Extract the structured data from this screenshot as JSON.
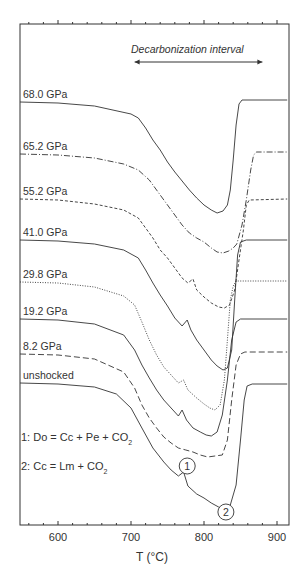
{
  "chart_data": {
    "type": "line",
    "title": "",
    "xlabel": "T (°C)",
    "ylabel": "",
    "xlim": [
      545,
      914
    ],
    "x_ticks": [
      600,
      700,
      800,
      900
    ],
    "x_tick_labels": [
      "600",
      "700",
      "800",
      "900"
    ],
    "grid": false,
    "annotation_arrow": {
      "text": "Decarbonization interval",
      "x_from": 705,
      "x_to": 880
    },
    "reactions": [
      {
        "label": "1: Do = Cc + Pe + CO",
        "sub": "2"
      },
      {
        "label": "2: Cc = Lm + CO",
        "sub": "2"
      }
    ],
    "markers": [
      {
        "text": "1",
        "x": 777,
        "y_px": 466
      },
      {
        "text": "2",
        "x": 830,
        "y_px": 512
      }
    ],
    "y_units": "relative signal (px from top, offset curves)",
    "series": [
      {
        "name": "68.0 GPa",
        "style": "solid",
        "label_y": 101,
        "points": [
          [
            545,
            102
          ],
          [
            600,
            103
          ],
          [
            650,
            106
          ],
          [
            700,
            114
          ],
          [
            710,
            118
          ],
          [
            720,
            128
          ],
          [
            730,
            140
          ],
          [
            740,
            150
          ],
          [
            750,
            162
          ],
          [
            760,
            172
          ],
          [
            770,
            181
          ],
          [
            780,
            190
          ],
          [
            790,
            198
          ],
          [
            800,
            205
          ],
          [
            810,
            210
          ],
          [
            818,
            213
          ],
          [
            826,
            211
          ],
          [
            832,
            205
          ],
          [
            836,
            190
          ],
          [
            840,
            160
          ],
          [
            844,
            125
          ],
          [
            848,
            104
          ],
          [
            852,
            100
          ],
          [
            914,
            100
          ]
        ]
      },
      {
        "name": "65.2 GPa",
        "style": "dashdot",
        "label_y": 153,
        "points": [
          [
            545,
            154
          ],
          [
            600,
            155
          ],
          [
            650,
            158
          ],
          [
            690,
            164
          ],
          [
            710,
            170
          ],
          [
            725,
            180
          ],
          [
            740,
            195
          ],
          [
            750,
            205
          ],
          [
            760,
            215
          ],
          [
            770,
            225
          ],
          [
            780,
            233
          ],
          [
            790,
            238
          ],
          [
            800,
            242
          ],
          [
            810,
            248
          ],
          [
            818,
            252
          ],
          [
            826,
            253
          ],
          [
            834,
            251
          ],
          [
            840,
            248
          ],
          [
            845,
            244
          ],
          [
            852,
            225
          ],
          [
            858,
            200
          ],
          [
            864,
            170
          ],
          [
            868,
            155
          ],
          [
            872,
            152
          ],
          [
            914,
            152
          ]
        ]
      },
      {
        "name": "55.2 GPa",
        "style": "dashed",
        "label_y": 198,
        "points": [
          [
            545,
            199
          ],
          [
            600,
            200
          ],
          [
            650,
            204
          ],
          [
            690,
            210
          ],
          [
            710,
            218
          ],
          [
            720,
            228
          ],
          [
            730,
            238
          ],
          [
            740,
            250
          ],
          [
            750,
            258
          ],
          [
            760,
            268
          ],
          [
            770,
            278
          ],
          [
            778,
            283
          ],
          [
            785,
            279
          ],
          [
            790,
            290
          ],
          [
            800,
            297
          ],
          [
            810,
            303
          ],
          [
            820,
            307
          ],
          [
            828,
            308
          ],
          [
            835,
            305
          ],
          [
            842,
            290
          ],
          [
            848,
            260
          ],
          [
            854,
            230
          ],
          [
            858,
            205
          ],
          [
            862,
            200
          ],
          [
            914,
            199
          ]
        ]
      },
      {
        "name": "41.0 GPa",
        "style": "solid",
        "label_y": 239,
        "points": [
          [
            545,
            240
          ],
          [
            600,
            241
          ],
          [
            650,
            244
          ],
          [
            690,
            250
          ],
          [
            710,
            258
          ],
          [
            720,
            270
          ],
          [
            730,
            283
          ],
          [
            740,
            295
          ],
          [
            750,
            306
          ],
          [
            760,
            318
          ],
          [
            770,
            326
          ],
          [
            777,
            320
          ],
          [
            782,
            330
          ],
          [
            790,
            340
          ],
          [
            800,
            350
          ],
          [
            810,
            360
          ],
          [
            818,
            366
          ],
          [
            826,
            370
          ],
          [
            832,
            368
          ],
          [
            838,
            350
          ],
          [
            842,
            300
          ],
          [
            846,
            255
          ],
          [
            850,
            242
          ],
          [
            858,
            240
          ],
          [
            914,
            240
          ]
        ]
      },
      {
        "name": "29.8 GPa",
        "style": "dotted",
        "label_y": 281,
        "points": [
          [
            545,
            282
          ],
          [
            600,
            283
          ],
          [
            650,
            287
          ],
          [
            690,
            296
          ],
          [
            705,
            305
          ],
          [
            715,
            322
          ],
          [
            725,
            340
          ],
          [
            735,
            355
          ],
          [
            745,
            367
          ],
          [
            755,
            375
          ],
          [
            765,
            383
          ],
          [
            772,
            380
          ],
          [
            778,
            390
          ],
          [
            790,
            398
          ],
          [
            800,
            404
          ],
          [
            808,
            408
          ],
          [
            815,
            410
          ],
          [
            822,
            405
          ],
          [
            828,
            380
          ],
          [
            832,
            340
          ],
          [
            836,
            300
          ],
          [
            840,
            286
          ],
          [
            844,
            281
          ],
          [
            914,
            281
          ]
        ]
      },
      {
        "name": "19.2 GPa",
        "style": "solid",
        "label_y": 318,
        "points": [
          [
            545,
            319
          ],
          [
            600,
            320
          ],
          [
            650,
            324
          ],
          [
            690,
            335
          ],
          [
            705,
            350
          ],
          [
            715,
            365
          ],
          [
            725,
            378
          ],
          [
            735,
            390
          ],
          [
            745,
            400
          ],
          [
            755,
            408
          ],
          [
            765,
            416
          ],
          [
            770,
            410
          ],
          [
            776,
            420
          ],
          [
            785,
            428
          ],
          [
            795,
            432
          ],
          [
            803,
            435
          ],
          [
            810,
            436
          ],
          [
            818,
            432
          ],
          [
            825,
            415
          ],
          [
            832,
            380
          ],
          [
            838,
            340
          ],
          [
            844,
            322
          ],
          [
            850,
            319
          ],
          [
            914,
            319
          ]
        ]
      },
      {
        "name": "8.2 GPa",
        "style": "longdash",
        "label_y": 353,
        "points": [
          [
            545,
            354
          ],
          [
            600,
            355
          ],
          [
            650,
            359
          ],
          [
            690,
            372
          ],
          [
            705,
            388
          ],
          [
            715,
            405
          ],
          [
            725,
            418
          ],
          [
            735,
            428
          ],
          [
            745,
            437
          ],
          [
            755,
            443
          ],
          [
            765,
            448
          ],
          [
            775,
            450
          ],
          [
            785,
            452
          ],
          [
            795,
            455
          ],
          [
            805,
            457
          ],
          [
            815,
            456
          ],
          [
            825,
            455
          ],
          [
            832,
            440
          ],
          [
            838,
            400
          ],
          [
            844,
            365
          ],
          [
            850,
            354
          ],
          [
            856,
            352
          ],
          [
            914,
            352
          ]
        ]
      },
      {
        "name": "unshocked",
        "style": "solid",
        "label_y": 382,
        "points": [
          [
            545,
            383
          ],
          [
            600,
            384
          ],
          [
            650,
            387
          ],
          [
            680,
            394
          ],
          [
            700,
            408
          ],
          [
            715,
            428
          ],
          [
            730,
            448
          ],
          [
            745,
            462
          ],
          [
            755,
            470
          ],
          [
            765,
            476
          ],
          [
            772,
            472
          ],
          [
            778,
            486
          ],
          [
            790,
            494
          ],
          [
            800,
            498
          ],
          [
            810,
            503
          ],
          [
            820,
            507
          ],
          [
            828,
            509
          ],
          [
            836,
            505
          ],
          [
            844,
            485
          ],
          [
            850,
            440
          ],
          [
            855,
            400
          ],
          [
            859,
            386
          ],
          [
            866,
            384
          ],
          [
            914,
            384
          ]
        ]
      }
    ]
  }
}
